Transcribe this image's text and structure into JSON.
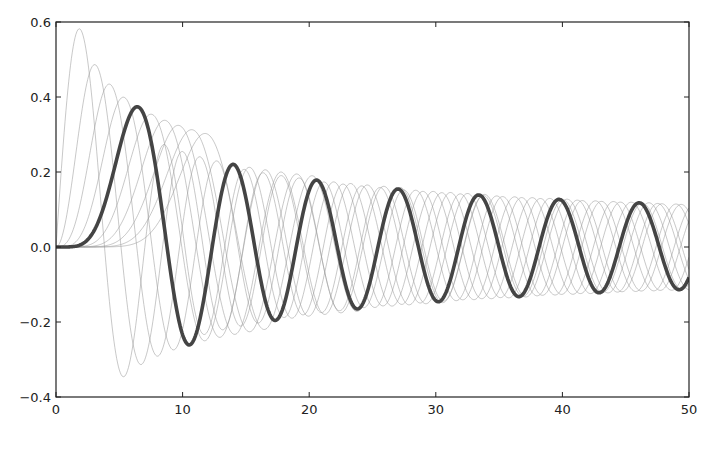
{
  "chart_data": {
    "type": "line",
    "title": "",
    "xlabel": "",
    "ylabel": "",
    "xlim": [
      0,
      50
    ],
    "ylim": [
      -0.4,
      0.6
    ],
    "grid": false,
    "legend": null,
    "x_ticks": [
      0,
      10,
      20,
      30,
      40,
      50
    ],
    "x_tick_labels": [
      "0",
      "10",
      "20",
      "30",
      "40",
      "50"
    ],
    "y_ticks": [
      -0.4,
      -0.2,
      0.0,
      0.2,
      0.4,
      0.6
    ],
    "y_tick_labels": [
      "−0.4",
      "−0.2",
      "0.0",
      "0.2",
      "0.4",
      "0.6"
    ],
    "sampling": {
      "x_start": 0,
      "x_end": 50,
      "points": 700
    },
    "series": [
      {
        "name": "J_1(x)",
        "order": 1,
        "highlight": false,
        "first_max": [
          1.84,
          0.582
        ],
        "first_min": [
          5.33,
          -0.346
        ]
      },
      {
        "name": "J_2(x)",
        "order": 2,
        "highlight": false,
        "first_max": [
          3.05,
          0.486
        ],
        "first_min": [
          6.71,
          -0.3
        ]
      },
      {
        "name": "J_3(x)",
        "order": 3,
        "highlight": false,
        "first_max": [
          4.2,
          0.434
        ],
        "first_min": [
          8.02,
          -0.291
        ]
      },
      {
        "name": "J_4(x)",
        "order": 4,
        "highlight": false,
        "first_max": [
          5.32,
          0.4
        ],
        "first_min": [
          9.28,
          -0.278
        ]
      },
      {
        "name": "J_5(x)",
        "order": 5,
        "highlight": true,
        "first_max": [
          6.42,
          0.372
        ],
        "first_min": [
          10.52,
          -0.26
        ],
        "peaks_x": [
          6.4,
          13.9,
          20.7,
          27.1,
          33.5,
          39.8,
          46.1
        ],
        "value_at_50": -0.1
      },
      {
        "name": "J_6(x)",
        "order": 6,
        "highlight": false,
        "first_max": [
          7.5,
          0.362
        ],
        "first_min": [
          11.73,
          -0.23
        ]
      },
      {
        "name": "J_7(x)",
        "order": 7,
        "highlight": false,
        "first_max": [
          8.58,
          0.348
        ]
      },
      {
        "name": "J_8(x)",
        "order": 8,
        "highlight": false,
        "first_max": [
          9.65,
          0.337
        ]
      },
      {
        "name": "J_9(x)",
        "order": 9,
        "highlight": false,
        "first_max": [
          10.71,
          0.327
        ]
      },
      {
        "name": "J_10(x)",
        "order": 10,
        "highlight": false,
        "first_max": [
          11.77,
          0.318
        ]
      }
    ],
    "envelope_at_50": 0.113
  },
  "style": {
    "thin_color": "#9a9a9a",
    "thin_opacity": 0.55,
    "thin_width": 1,
    "thick_color": "#444444",
    "thick_width": 3.6,
    "axis_color": "#222222",
    "background": "#ffffff"
  },
  "layout": {
    "plot_left": 56,
    "plot_right": 689,
    "plot_top": 22,
    "plot_bottom": 397
  }
}
